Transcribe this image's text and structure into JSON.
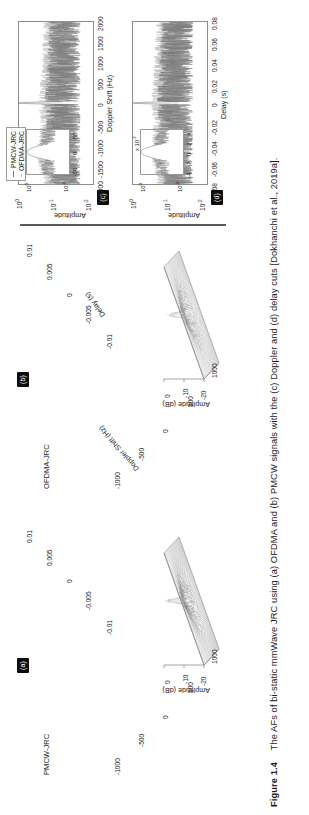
{
  "figure": {
    "number": "Figure 1.4",
    "caption": "The AFs of bi-static mmWave JRC using (a) OFDMA and (b) PMCW signals with the (c) Doppler and (d) delay cuts [Dokhanchi et al., 2019a]."
  },
  "legend": {
    "items": [
      {
        "label": "PMCW-JRC",
        "color": "#777777"
      },
      {
        "label": "OFDMA-JRC",
        "color": "#b8b8b8"
      }
    ]
  },
  "panels": {
    "a": {
      "badge": "(a)",
      "title": "PMCW-JRC",
      "zlabel": "Amplitude (dB)",
      "zticks": [
        "0",
        "-10",
        "-20"
      ],
      "xlabel": "Doppler Shift (Hz)",
      "xticks": [
        "1000",
        "500",
        "0",
        "-500",
        "-1000"
      ],
      "ylabel": "Delay (s)",
      "yticks": [
        "-0.01",
        "-0.005",
        "0",
        "0.005",
        "0.01"
      ]
    },
    "b": {
      "badge": "(b)",
      "title": "OFDMA-JRC",
      "zlabel": "Amplitude (dB)",
      "zticks": [
        "0",
        "-10",
        "-20"
      ],
      "xlabel": "Doppler Shift (Hz)",
      "xticks": [
        "1000",
        "500",
        "0",
        "-500",
        "-1000"
      ],
      "ylabel": "Delay (s)",
      "yticks": [
        "-0.01",
        "-0.005",
        "0",
        "0.005",
        "0.01"
      ]
    },
    "c": {
      "badge": "(c)",
      "ylabel": "Amplitude",
      "yticks": [
        "10^0",
        "10^-1",
        "10^-2"
      ],
      "xlabel": "Doppler Shift (Hz)",
      "xticks": [
        "-2000",
        "-1500",
        "-1000",
        "-500",
        "0",
        "500",
        "1000",
        "1500",
        "2000"
      ],
      "inset": {
        "yticks": [
          "10^0",
          "10^-2"
        ],
        "xticks": [
          "-50",
          "0",
          "50"
        ]
      }
    },
    "d": {
      "badge": "(d)",
      "ylabel": "Amplitude",
      "yticks": [
        "10^0",
        "10^-1",
        "10^-2"
      ],
      "xlabel": "Delay (s)",
      "xticks": [
        "-0.08",
        "-0.06",
        "-0.04",
        "-0.02",
        "0",
        "0.02",
        "0.04",
        "0.06",
        "0.08"
      ],
      "inset": {
        "yticks": [
          "10^0",
          "10^-2"
        ],
        "xticks": [
          "-4",
          "-2",
          "0",
          "2",
          "4"
        ],
        "xscale": "x 10^-3"
      }
    }
  },
  "chart_data": [
    {
      "type": "surface",
      "panel": "a",
      "title": "PMCW-JRC",
      "xlabel": "Doppler Shift (Hz)",
      "ylabel": "Delay (s)",
      "zlabel": "Amplitude (dB)",
      "xlim": [
        -1000,
        1000
      ],
      "ylim": [
        -0.01,
        0.01
      ],
      "zlim": [
        -20,
        0
      ],
      "xticks": [
        1000,
        500,
        0,
        -500,
        -1000
      ],
      "yticks": [
        -0.01,
        -0.005,
        0,
        0.005,
        0.01
      ],
      "zticks": [
        0,
        -10,
        -20
      ],
      "description": "Thumbtack ambiguity function: sharp central peak at (0,0) reaching 0 dB, surrounded by a noisy sidelobe pedestal around -12 to -18 dB."
    },
    {
      "type": "surface",
      "panel": "b",
      "title": "OFDMA-JRC",
      "xlabel": "Doppler Shift (Hz)",
      "ylabel": "Delay (s)",
      "zlabel": "Amplitude (dB)",
      "xlim": [
        -1000,
        1000
      ],
      "ylim": [
        -0.01,
        0.01
      ],
      "zlim": [
        -20,
        0
      ],
      "xticks": [
        1000,
        500,
        0,
        -500,
        -1000
      ],
      "yticks": [
        -0.01,
        -0.005,
        0,
        0.005,
        0.01
      ],
      "zticks": [
        0,
        -10,
        -20
      ],
      "description": "Thumbtack ambiguity function with a denser sidelobe floor than PMCW; central peak at 0 dB, pedestal around -10 to -18 dB."
    },
    {
      "type": "line",
      "panel": "c",
      "title": "Doppler cut",
      "xlabel": "Doppler Shift (Hz)",
      "ylabel": "Amplitude",
      "yscale": "log",
      "xlim": [
        -2000,
        2000
      ],
      "ylim": [
        0.01,
        1
      ],
      "xticks": [
        -2000,
        -1500,
        -1000,
        -500,
        0,
        500,
        1000,
        1500,
        2000
      ],
      "ytick_labels": [
        "10^0",
        "10^-1",
        "10^-2"
      ],
      "series": [
        {
          "name": "PMCW-JRC",
          "color": "#777777",
          "description": "Peak of amplitude 1 at 0 Hz, noisy sidelobes oscillating between 0.02 and 0.2 across the band."
        },
        {
          "name": "OFDMA-JRC",
          "color": "#b8b8b8",
          "description": "Peak of amplitude 1 at 0 Hz, sidelobes slightly higher, between 0.03 and 0.3."
        }
      ],
      "inset": {
        "xlim": [
          -60,
          60
        ],
        "ylim": [
          0.01,
          1
        ],
        "xticks": [
          -50,
          0,
          50
        ],
        "ytick_labels": [
          "10^0",
          "10^-2"
        ],
        "description": "Zoom on the main Doppler lobe near 0 Hz."
      }
    },
    {
      "type": "line",
      "panel": "d",
      "title": "Delay cut",
      "xlabel": "Delay (s)",
      "ylabel": "Amplitude",
      "yscale": "log",
      "xlim": [
        -0.08,
        0.08
      ],
      "ylim": [
        0.01,
        1
      ],
      "xticks": [
        -0.08,
        -0.06,
        -0.04,
        -0.02,
        0,
        0.02,
        0.04,
        0.06,
        0.08
      ],
      "ytick_labels": [
        "10^0",
        "10^-1",
        "10^-2"
      ],
      "series": [
        {
          "name": "PMCW-JRC",
          "color": "#777777",
          "description": "Narrow peak of amplitude 1 at 0 s, noisy sidelobe floor 0.02 to 0.2."
        },
        {
          "name": "OFDMA-JRC",
          "color": "#b8b8b8",
          "description": "Narrow peak of amplitude 1 at 0 s, sidelobe floor 0.03 to 0.3."
        }
      ],
      "inset": {
        "xlim": [
          -0.005,
          0.005
        ],
        "xscale": "x 10^-3",
        "ylim": [
          0.01,
          1
        ],
        "xticks": [
          -4,
          -2,
          0,
          2,
          4
        ],
        "ytick_labels": [
          "10^0",
          "10^-2"
        ],
        "description": "Zoom on the main delay lobe near 0 s."
      }
    }
  ]
}
